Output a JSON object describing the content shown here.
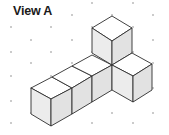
{
  "title": "View A",
  "colors": {
    "background": "#ffffff",
    "edge": "#2e2e2e",
    "dot": "#8a8a8a",
    "top_face": "#ffffff",
    "left_face": "#ececec",
    "right_face": "#e2e2e2"
  },
  "dot_grid": {
    "even_columns_x": [
      11,
      51,
      92,
      133
    ],
    "even_rows_y": [
      3,
      27,
      52,
      76,
      101,
      123
    ],
    "odd_columns_x": [
      31,
      72,
      112,
      153
    ],
    "odd_rows_y": [
      15,
      40,
      63,
      88,
      113
    ]
  },
  "figure": {
    "cube_count": 6,
    "faces": [
      {
        "name": "row-cube-1-top",
        "type": "top",
        "points": "31,88 51,99 72,88 52,77"
      },
      {
        "name": "row-cube-1-left",
        "type": "left",
        "points": "31,88 51,99 51,126 31,114"
      },
      {
        "name": "row-cube-1-right",
        "type": "right",
        "points": "51,99 72,88 72,114 51,126"
      },
      {
        "name": "row-cube-2-top",
        "type": "top",
        "points": "52,77 72,88 92,76 72,66"
      },
      {
        "name": "row-cube-2-right",
        "type": "right",
        "points": "72,88 92,76 92,102 72,114"
      },
      {
        "name": "row-cube-3-top",
        "type": "top",
        "points": "72,66 92,76 112,65 92,55"
      },
      {
        "name": "row-cube-3-right",
        "type": "right",
        "points": "92,76 112,65 112,90 92,102"
      },
      {
        "name": "upper-cube-top",
        "type": "top",
        "points": "112,16 132,28 112,41 92,28"
      },
      {
        "name": "upper-cube-left",
        "type": "left",
        "points": "92,28 112,41 112,65 92,53"
      },
      {
        "name": "upper-cube-right",
        "type": "right",
        "points": "112,41 132,28 132,53 112,65"
      },
      {
        "name": "side-cube-top",
        "type": "top",
        "points": "112,65 132,53 152,64 133,76"
      },
      {
        "name": "side-cube-left",
        "type": "left",
        "points": "112,65 133,76 133,102 112,90"
      },
      {
        "name": "side-cube-right",
        "type": "right",
        "points": "133,76 152,64 152,90 133,102"
      }
    ]
  }
}
